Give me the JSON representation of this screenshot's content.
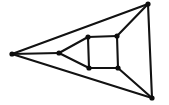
{
  "figure": {
    "title": "",
    "caption": "",
    "background_color": "#ffffff",
    "width": 169,
    "height": 105
  },
  "graph_data": {
    "type": "diagram",
    "diagram_kind": "planar-graph-drawing",
    "description": "Planar drawing of a cube-like graph: an outer triangle with a left hub vertex and an inner quadrilateral face",
    "edge_color": "#121212",
    "vertex_color": "#0d0d0d",
    "edge_width": 2.1,
    "vertex_radius": 2.6,
    "vertex_count": 8,
    "edge_count": 12,
    "vertices": [
      {
        "id": "v-left",
        "label": "",
        "x": 12,
        "y": 54
      },
      {
        "id": "v-top-right",
        "label": "",
        "x": 148,
        "y": 4
      },
      {
        "id": "v-bottom-right",
        "label": "",
        "x": 152,
        "y": 98
      },
      {
        "id": "v-hub",
        "label": "",
        "x": 59,
        "y": 53
      },
      {
        "id": "v-square-top-left",
        "label": "",
        "x": 88,
        "y": 37
      },
      {
        "id": "v-square-top-right",
        "label": "",
        "x": 117,
        "y": 36
      },
      {
        "id": "v-square-bottom-right",
        "label": "",
        "x": 118,
        "y": 68
      },
      {
        "id": "v-square-bottom-left",
        "label": "",
        "x": 89,
        "y": 68
      }
    ],
    "edges": [
      {
        "id": "e-outer-top",
        "from": "v-left",
        "to": "v-top-right"
      },
      {
        "id": "e-outer-bottom",
        "from": "v-left",
        "to": "v-bottom-right"
      },
      {
        "id": "e-outer-right",
        "from": "v-top-right",
        "to": "v-bottom-right"
      },
      {
        "id": "e-left-hub",
        "from": "v-left",
        "to": "v-hub"
      },
      {
        "id": "e-hub-square-top-left",
        "from": "v-hub",
        "to": "v-square-top-left"
      },
      {
        "id": "e-hub-square-bottom-left",
        "from": "v-hub",
        "to": "v-square-bottom-left"
      },
      {
        "id": "e-square-top",
        "from": "v-square-top-left",
        "to": "v-square-top-right"
      },
      {
        "id": "e-square-right",
        "from": "v-square-top-right",
        "to": "v-square-bottom-right"
      },
      {
        "id": "e-square-bottom",
        "from": "v-square-bottom-right",
        "to": "v-square-bottom-left"
      },
      {
        "id": "e-square-left",
        "from": "v-square-bottom-left",
        "to": "v-square-top-left"
      },
      {
        "id": "e-square-top-right-to-outer",
        "from": "v-square-top-right",
        "to": "v-top-right"
      },
      {
        "id": "e-square-bottom-right-to-outer",
        "from": "v-square-bottom-right",
        "to": "v-bottom-right"
      }
    ]
  }
}
